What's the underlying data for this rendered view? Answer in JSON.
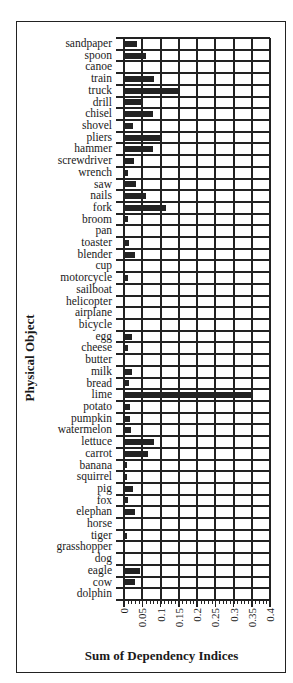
{
  "chart_data": {
    "type": "bar",
    "orientation": "horizontal",
    "title": "",
    "xlabel": "Sum of Dependency Indices",
    "ylabel": "Physical Object",
    "xlim": [
      0,
      0.4
    ],
    "xticks": [
      "0",
      "0.05",
      "0.1",
      "0.15",
      "0.2",
      "0.25",
      "0.3",
      "0.35",
      "0.4"
    ],
    "grid": true,
    "legend": null,
    "categories": [
      "sandpaper",
      "spoon",
      "canoe",
      "train",
      "truck",
      "drill",
      "chisel",
      "shovel",
      "pliers",
      "hammer",
      "screwdriver",
      "wrench",
      "saw",
      "nails",
      "fork",
      "broom",
      "pan",
      "toaster",
      "blender",
      "cup",
      "motorcycle",
      "sailboat",
      "helicopter",
      "airplane",
      "bicycle",
      "egg",
      "cheese",
      "butter",
      "milk",
      "bread",
      "lime",
      "potato",
      "pumpkin",
      "watermelon",
      "lettuce",
      "carrot",
      "banana",
      "squirrel",
      "pig",
      "fox",
      "elephan",
      "horse",
      "tiger",
      "grasshopper",
      "dog",
      "eagle",
      "cow",
      "dolphin"
    ],
    "values": [
      0.036,
      0.059,
      0,
      0.083,
      0.152,
      0.05,
      0.08,
      0.024,
      0.1,
      0.08,
      0.028,
      0.01,
      0.033,
      0.06,
      0.115,
      0.01,
      0,
      0.013,
      0.031,
      0,
      0.01,
      0,
      0,
      0,
      0,
      0.021,
      0.01,
      0,
      0.021,
      0.013,
      0.351,
      0.016,
      0.016,
      0.02,
      0.081,
      0.066,
      0.009,
      0.009,
      0.024,
      0.012,
      0.031,
      0,
      0.007,
      0,
      0,
      0.044,
      0.029,
      0
    ]
  }
}
